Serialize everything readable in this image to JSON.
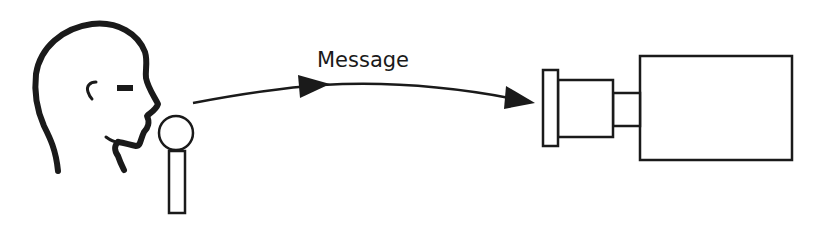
{
  "diagram": {
    "arrow_label": "Message",
    "elements": [
      {
        "id": "person-head",
        "type": "icon",
        "name": "speaker head profile"
      },
      {
        "id": "microphone",
        "type": "icon",
        "name": "microphone"
      },
      {
        "id": "message-arrow",
        "type": "arrow",
        "label": "Message"
      },
      {
        "id": "camera",
        "type": "icon",
        "name": "camera"
      }
    ],
    "colors": {
      "stroke": "#1a1a1a",
      "background": "#ffffff"
    }
  }
}
